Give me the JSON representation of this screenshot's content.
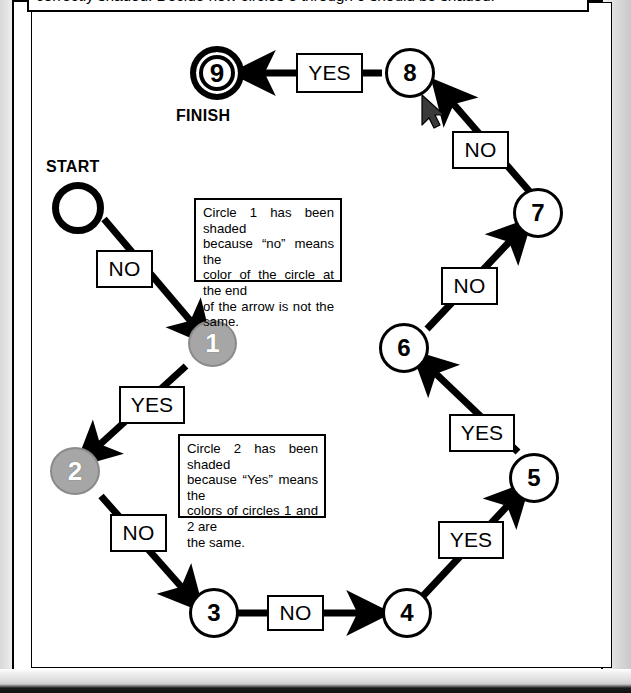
{
  "instruction": {
    "text": "correctly shaded. Decide how circles 3 through 9 should be shaded."
  },
  "diagram": {
    "type": "flowchart",
    "start_caption": "START",
    "finish_caption": "FINISH",
    "nodes": [
      {
        "id": "start",
        "label": "",
        "shading": "unshaded",
        "style": "start"
      },
      {
        "id": "1",
        "label": "1",
        "shading": "shaded",
        "style": "circle"
      },
      {
        "id": "2",
        "label": "2",
        "shading": "shaded",
        "style": "circle"
      },
      {
        "id": "3",
        "label": "3",
        "shading": "unshaded",
        "style": "circle"
      },
      {
        "id": "4",
        "label": "4",
        "shading": "unshaded",
        "style": "circle"
      },
      {
        "id": "5",
        "label": "5",
        "shading": "unshaded",
        "style": "circle"
      },
      {
        "id": "6",
        "label": "6",
        "shading": "unshaded",
        "style": "circle"
      },
      {
        "id": "7",
        "label": "7",
        "shading": "unshaded",
        "style": "circle"
      },
      {
        "id": "8",
        "label": "8",
        "shading": "unshaded",
        "style": "circle"
      },
      {
        "id": "9",
        "label": "9",
        "shading": "unshaded",
        "style": "finish"
      }
    ],
    "edges": [
      {
        "from": "start",
        "to": "1",
        "label": "NO"
      },
      {
        "from": "1",
        "to": "2",
        "label": "YES"
      },
      {
        "from": "2",
        "to": "3",
        "label": "NO"
      },
      {
        "from": "3",
        "to": "4",
        "label": "NO"
      },
      {
        "from": "4",
        "to": "5",
        "label": "YES"
      },
      {
        "from": "5",
        "to": "6",
        "label": "YES"
      },
      {
        "from": "6",
        "to": "7",
        "label": "NO"
      },
      {
        "from": "7",
        "to": "8",
        "label": "NO"
      },
      {
        "from": "8",
        "to": "9",
        "label": "YES"
      }
    ],
    "notes": [
      {
        "id": "note-circle-1",
        "lines": [
          "Circle 1 has been shaded",
          "because “no” means the",
          "color of the circle at the end",
          "of the arrow is not the same."
        ]
      },
      {
        "id": "note-circle-2",
        "lines": [
          "Circle 2 has been shaded",
          "because “Yes” means the",
          "colors of circles 1 and 2 are",
          "the same."
        ]
      }
    ]
  },
  "colors": {
    "ink": "#000000",
    "paper": "#ffffff",
    "shaded_fill": "#a6a6a6",
    "shaded_text": "#ffffff"
  }
}
